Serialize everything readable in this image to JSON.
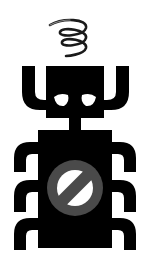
{
  "image": {
    "subject": "sad robot bug with prohibition sign",
    "alt": "Black pictogram of a sad bug-like robot with raised arms, six hooked legs, a spring coil above its head, and a gray prohibition symbol on its body"
  },
  "colors": {
    "background": "#ffffff",
    "figure": "#000000",
    "prohibition": "#4a4a4a",
    "eyes": "#ffffff",
    "spring": "#1a1a1a"
  },
  "icons": {
    "spring": "spring-coil-icon",
    "robot": "robot-bug-icon",
    "prohibition": "prohibition-icon"
  }
}
